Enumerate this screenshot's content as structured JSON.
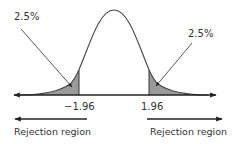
{
  "colors": {
    "line": "#333333",
    "curve": "#444444",
    "shade": "#9a9a9a",
    "text": "#333333"
  },
  "labels": {
    "left_tail_pct": "2.5%",
    "right_tail_pct": "2.5%",
    "left_critical": "−1.96",
    "right_critical": "1.96",
    "left_region": "Rejection region",
    "right_region": "Rejection region"
  },
  "diagram": {
    "type": "normal-distribution",
    "critical_values": [
      -1.96,
      1.96
    ],
    "tail_areas_percent": [
      2.5,
      2.5
    ]
  }
}
